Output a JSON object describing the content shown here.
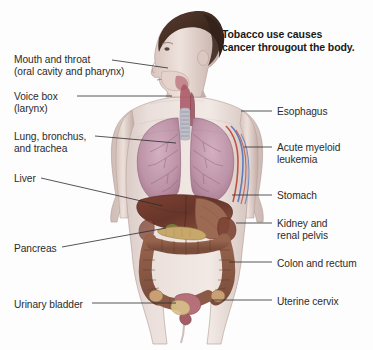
{
  "figure": {
    "title_line1": "Tobacco use causes",
    "title_line2": "cancer througout the body.",
    "background_color": "#fdfdfd",
    "text_color": "#2b2b2b"
  },
  "labels_left": [
    {
      "name": "mouth-and-throat",
      "line1": "Mouth and throat",
      "line2": "(oral cavity and pharynx)",
      "x": 14,
      "y": 54,
      "leader": [
        [
          112,
          60
        ],
        [
          168,
          68
        ]
      ]
    },
    {
      "name": "voice-box",
      "line1": "Voice box",
      "line2": "(larynx)",
      "x": 14,
      "y": 91,
      "leader": [
        [
          77,
          96
        ],
        [
          172,
          96
        ]
      ]
    },
    {
      "name": "lung-bronchus-and-trachea",
      "line1": "Lung, bronchus,",
      "line2": "and trachea",
      "x": 14,
      "y": 131,
      "leader": [
        [
          95,
          136
        ],
        [
          176,
          143
        ]
      ]
    },
    {
      "name": "liver",
      "line1": "Liver",
      "line2": "",
      "x": 14,
      "y": 173,
      "leader": [
        [
          41,
          178
        ],
        [
          163,
          206
        ]
      ]
    },
    {
      "name": "pancreas",
      "line1": "Pancreas",
      "line2": "",
      "x": 14,
      "y": 243,
      "leader": [
        [
          62,
          247
        ],
        [
          166,
          228
        ]
      ]
    },
    {
      "name": "urinary-bladder",
      "line1": "Urinary bladder",
      "line2": "",
      "x": 14,
      "y": 299,
      "leader": [
        [
          92,
          303
        ],
        [
          176,
          303
        ]
      ]
    }
  ],
  "labels_right": [
    {
      "name": "esophagus",
      "line1": "Esophagus",
      "line2": "",
      "x": 277,
      "y": 106,
      "leader": [
        [
          241,
          111
        ],
        [
          272,
          111
        ]
      ]
    },
    {
      "name": "acute-myeloid-leukemia",
      "line1": "Acute myeloid",
      "line2": "leukemia",
      "x": 277,
      "y": 142,
      "leader": [
        [
          244,
          147
        ],
        [
          272,
          147
        ]
      ]
    },
    {
      "name": "stomach",
      "line1": "Stomach",
      "line2": "",
      "x": 277,
      "y": 190,
      "leader": [
        [
          232,
          195
        ],
        [
          272,
          195
        ]
      ]
    },
    {
      "name": "kidney-and-renal-pelvis",
      "line1": "Kidney and",
      "line2": "renal pelvis",
      "x": 277,
      "y": 218,
      "leader": [
        [
          236,
          223
        ],
        [
          272,
          223
        ]
      ]
    },
    {
      "name": "colon-and-rectum",
      "line1": "Colon and rectum",
      "line2": "",
      "x": 277,
      "y": 258,
      "leader": [
        [
          229,
          262
        ],
        [
          272,
          262
        ]
      ]
    },
    {
      "name": "uterine-cervix",
      "line1": "Uterine cervix",
      "line2": "",
      "x": 277,
      "y": 296,
      "leader": [
        [
          212,
          300
        ],
        [
          272,
          300
        ]
      ]
    }
  ],
  "anatomy_colors": {
    "skin": "#e9dcd8",
    "skin_shade": "#cbb8b3",
    "hair": "#4a3228",
    "lung": "#c39cae",
    "lung_dark": "#a87b92",
    "liver": "#6e3a2d",
    "liver_light": "#8a4c38",
    "colon": "#8a5a46",
    "stomach": "#9c6a52",
    "pancreas": "#c8a86a",
    "trachea": "#b9b9c4",
    "artery": "#c0392b",
    "vein": "#4a6fb5",
    "uterus": "#b5707a",
    "bladder": "#d9c08a"
  }
}
